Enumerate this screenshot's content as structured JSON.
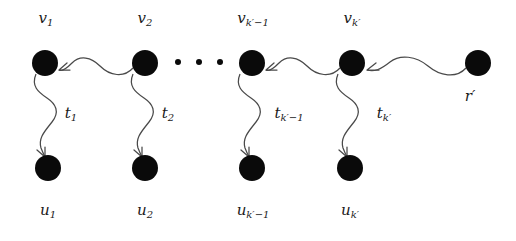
{
  "figure": {
    "background_color": "#ffffff",
    "node_color": "#0a0a0a",
    "edge_color": "#4a4a4a",
    "label_color": "#1a1a1a"
  },
  "top_nodes": [
    {
      "id": "v1",
      "label_html": "v<sub>1</sub>",
      "label_plain": "v_1",
      "cx": 45,
      "cy": 63,
      "r": 13,
      "label_x": 46,
      "label_y": 18
    },
    {
      "id": "v2",
      "label_html": "v<sub>2</sub>",
      "label_plain": "v_2",
      "cx": 145,
      "cy": 63,
      "r": 13,
      "label_x": 145,
      "label_y": 18
    },
    {
      "id": "vkm1",
      "label_html": "v<sub>k&prime;&minus;1</sub>",
      "label_plain": "v_{k'-1}",
      "cx": 252,
      "cy": 63,
      "r": 13,
      "label_x": 253,
      "label_y": 18
    },
    {
      "id": "vk",
      "label_html": "v<sub>k&prime;</sub>",
      "label_plain": "v_{k'}",
      "cx": 352,
      "cy": 63,
      "r": 13,
      "label_x": 352,
      "label_y": 18
    },
    {
      "id": "rprime",
      "label_html": "r&prime;",
      "label_plain": "r'",
      "cx": 478,
      "cy": 63,
      "r": 13,
      "label_x": 470,
      "label_y": 96
    }
  ],
  "bottom_nodes": [
    {
      "id": "u1",
      "label_html": "u<sub>1</sub>",
      "label_plain": "u_1",
      "cx": 48,
      "cy": 168,
      "r": 13,
      "label_x": 48,
      "label_y": 210
    },
    {
      "id": "u2",
      "label_html": "u<sub>2</sub>",
      "label_plain": "u_2",
      "cx": 145,
      "cy": 168,
      "r": 13,
      "label_x": 145,
      "label_y": 210
    },
    {
      "id": "ukm1",
      "label_html": "u<sub>k&prime;&minus;1</sub>",
      "label_plain": "u_{k'-1}",
      "cx": 252,
      "cy": 168,
      "r": 13,
      "label_x": 253,
      "label_y": 210
    },
    {
      "id": "uk",
      "label_html": "u<sub>k&prime;</sub>",
      "label_plain": "u_{k'}",
      "cx": 350,
      "cy": 168,
      "r": 13,
      "label_x": 350,
      "label_y": 210
    }
  ],
  "vertical_edges": [
    {
      "from": "v1",
      "to": "u1",
      "label_html": "t<sub>1</sub>",
      "label_plain": "t_1",
      "label_x": 71,
      "label_y": 113
    },
    {
      "from": "v2",
      "to": "u2",
      "label_html": "t<sub>2</sub>",
      "label_plain": "t_2",
      "label_x": 168,
      "label_y": 113
    },
    {
      "from": "vkm1",
      "to": "ukm1",
      "label_html": "t<sub>k&prime;&minus;1</sub>",
      "label_plain": "t_{k'-1}",
      "label_x": 289,
      "label_y": 113
    },
    {
      "from": "vk",
      "to": "uk",
      "label_html": "t<sub>k&prime;</sub>",
      "label_plain": "t_{k'}",
      "label_x": 384,
      "label_y": 113
    }
  ],
  "horizontal_edges": [
    {
      "from": "v2",
      "to": "v1",
      "direction": "right-to-left"
    },
    {
      "from": "vk",
      "to": "vkm1",
      "direction": "right-to-left"
    },
    {
      "from": "rprime",
      "to": "vk",
      "direction": "right-to-left"
    }
  ],
  "ellipsis": {
    "label_plain": "...",
    "dots": [
      {
        "cx": 178,
        "cy": 62,
        "r": 3
      },
      {
        "cx": 199,
        "cy": 62,
        "r": 3
      },
      {
        "cx": 220,
        "cy": 62,
        "r": 3
      }
    ]
  }
}
